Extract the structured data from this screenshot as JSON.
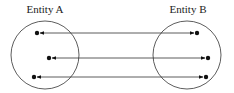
{
  "diagram": {
    "entities": [
      {
        "label": "Entity A",
        "cx": 45,
        "cy": 55,
        "r": 34,
        "label_x": 45,
        "label_y": 13
      },
      {
        "label": "Entity B",
        "cx": 187,
        "cy": 55,
        "r": 34,
        "label_x": 188,
        "label_y": 13
      }
    ],
    "links": [
      {
        "a": [
          37,
          33
        ],
        "b": [
          197,
          33
        ]
      },
      {
        "a": [
          49,
          58
        ],
        "b": [
          208,
          58
        ]
      },
      {
        "a": [
          34,
          77
        ],
        "b": [
          206,
          77
        ]
      }
    ],
    "colors": {
      "stroke": "#333333",
      "dot": "#111111"
    },
    "arrow_style": "bidirectional"
  }
}
